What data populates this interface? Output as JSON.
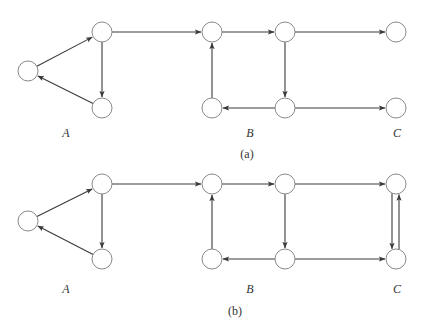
{
  "panels": [
    {
      "id": "a",
      "caption": "(a)",
      "offset_y": 0,
      "group_labels": [
        {
          "text": "A",
          "x": 66,
          "y": 137
        },
        {
          "text": "B",
          "x": 250,
          "y": 137
        },
        {
          "text": "C",
          "x": 397,
          "y": 137
        }
      ],
      "caption_pos": {
        "x": 247,
        "y": 158
      },
      "nodes": [
        {
          "id": "A0",
          "x": 28,
          "y": 71
        },
        {
          "id": "A1",
          "x": 102,
          "y": 32
        },
        {
          "id": "A2",
          "x": 102,
          "y": 108
        },
        {
          "id": "B0",
          "x": 212,
          "y": 32
        },
        {
          "id": "B1",
          "x": 285,
          "y": 32
        },
        {
          "id": "B2",
          "x": 212,
          "y": 108
        },
        {
          "id": "B3",
          "x": 285,
          "y": 108
        },
        {
          "id": "C0",
          "x": 396,
          "y": 32
        },
        {
          "id": "C1",
          "x": 396,
          "y": 108
        }
      ],
      "edges": [
        {
          "from": "A0",
          "to": "A1"
        },
        {
          "from": "A1",
          "to": "A2"
        },
        {
          "from": "A2",
          "to": "A0"
        },
        {
          "from": "A1",
          "to": "B0"
        },
        {
          "from": "B0",
          "to": "B1"
        },
        {
          "from": "B1",
          "to": "B3"
        },
        {
          "from": "B3",
          "to": "B2"
        },
        {
          "from": "B2",
          "to": "B0"
        },
        {
          "from": "B1",
          "to": "C0"
        },
        {
          "from": "B3",
          "to": "C1"
        }
      ]
    },
    {
      "id": "b",
      "caption": "(b)",
      "offset_y": 152,
      "group_labels": [
        {
          "text": "A",
          "x": 66,
          "y": 293
        },
        {
          "text": "B",
          "x": 250,
          "y": 293
        },
        {
          "text": "C",
          "x": 397,
          "y": 293
        }
      ],
      "caption_pos": {
        "x": 235,
        "y": 315
      },
      "nodes": [
        {
          "id": "A0",
          "x": 28,
          "y": 221
        },
        {
          "id": "A1",
          "x": 102,
          "y": 184
        },
        {
          "id": "A2",
          "x": 102,
          "y": 259
        },
        {
          "id": "B0",
          "x": 212,
          "y": 184
        },
        {
          "id": "B1",
          "x": 285,
          "y": 184
        },
        {
          "id": "B2",
          "x": 212,
          "y": 259
        },
        {
          "id": "B3",
          "x": 285,
          "y": 259
        },
        {
          "id": "C0",
          "x": 396,
          "y": 184
        },
        {
          "id": "C1",
          "x": 396,
          "y": 259
        }
      ],
      "edges": [
        {
          "from": "A0",
          "to": "A1"
        },
        {
          "from": "A1",
          "to": "A2"
        },
        {
          "from": "A2",
          "to": "A0"
        },
        {
          "from": "A1",
          "to": "B0"
        },
        {
          "from": "B0",
          "to": "B1"
        },
        {
          "from": "B1",
          "to": "B3"
        },
        {
          "from": "B3",
          "to": "B2"
        },
        {
          "from": "B2",
          "to": "B0"
        },
        {
          "from": "B1",
          "to": "C0"
        },
        {
          "from": "B3",
          "to": "C1"
        },
        {
          "from": "C0",
          "to": "C1",
          "dx": -4
        },
        {
          "from": "C1",
          "to": "C0",
          "dx": 3
        }
      ]
    }
  ],
  "style": {
    "node_radius": 10,
    "node_stroke": "#8a8a8a",
    "edge_color": "#3a3a3a"
  }
}
